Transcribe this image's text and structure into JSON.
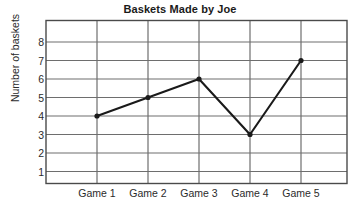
{
  "chart_data": {
    "type": "line",
    "title": "Baskets Made by Joe",
    "xlabel": "",
    "ylabel": "Number of baskets",
    "categories": [
      "Game 1",
      "Game 2",
      "Game 3",
      "Game 4",
      "Game 5"
    ],
    "values": [
      4,
      5,
      6,
      3,
      7
    ],
    "series": [
      {
        "name": "Baskets",
        "values": [
          4,
          5,
          6,
          3,
          7
        ]
      }
    ],
    "y_ticks": [
      1,
      2,
      3,
      4,
      5,
      6,
      7,
      8
    ],
    "y_tick_labels": [
      "1",
      "2",
      "3",
      "4",
      "5",
      "6",
      "7",
      "8"
    ],
    "ylim": [
      0,
      9
    ],
    "grid": true,
    "grid_horizontal": true,
    "grid_vertical": true,
    "legend": false,
    "legend_position": "none",
    "markers": true,
    "line_color": "#1a1a1a",
    "marker_color": "#1a1a1a",
    "grid_color": "#6e6e6e",
    "frame_color": "#4a4a4a",
    "background_color": "#ffffff"
  },
  "axes": {
    "y_title": "Number of baskets",
    "y_tick_1": "1",
    "y_tick_2": "2",
    "y_tick_3": "3",
    "y_tick_4": "4",
    "y_tick_5": "5",
    "y_tick_6": "6",
    "y_tick_7": "7",
    "y_tick_8": "8",
    "x_tick_1": "Game 1",
    "x_tick_2": "Game 2",
    "x_tick_3": "Game 3",
    "x_tick_4": "Game 4",
    "x_tick_5": "Game 5"
  },
  "header": {
    "title": "Baskets Made by Joe"
  }
}
